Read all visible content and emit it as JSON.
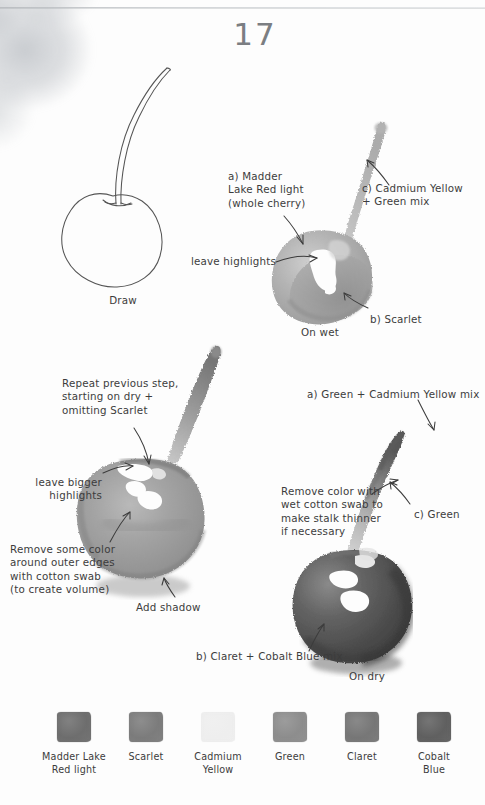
{
  "page": {
    "number": "17",
    "background_color": "#fdfdfd",
    "ink_color": "#3c3c3c"
  },
  "steps": [
    {
      "id": "draw",
      "caption": "Draw",
      "notes": []
    },
    {
      "id": "on-wet",
      "caption": "On wet",
      "notes": [
        {
          "name": "madder-lake-note",
          "text": "a) Madder\nLake Red light\n(whole cherry)"
        },
        {
          "name": "cadmium-green-note",
          "text": "c) Cadmium Yellow\n+ Green mix"
        },
        {
          "name": "leave-highlights-note",
          "text": "leave highlights"
        },
        {
          "name": "scarlet-note",
          "text": "b) Scarlet"
        }
      ]
    },
    {
      "id": "second-wash",
      "caption": "",
      "notes": [
        {
          "name": "repeat-step-note",
          "text": "Repeat previous step,\nstarting on dry +\nomitting Scarlet"
        },
        {
          "name": "leave-bigger-highlights-note",
          "text": "leave bigger\nhighlights"
        },
        {
          "name": "remove-color-edges-note",
          "text": "Remove some color\naround outer edges\nwith cotton swab\n(to create volume)"
        },
        {
          "name": "add-shadow-note",
          "text": "Add shadow"
        }
      ]
    },
    {
      "id": "on-dry",
      "caption": "On dry",
      "notes": [
        {
          "name": "green-cadmium-note",
          "text": "a) Green + Cadmium Yellow mix"
        },
        {
          "name": "remove-color-stalk-note",
          "text": "Remove color with\nwet cotton swab to\nmake stalk thinner\nif necessary"
        },
        {
          "name": "green-note",
          "text": "c) Green"
        },
        {
          "name": "claret-cobalt-note",
          "text": "b) Claret + Cobalt Blue mix"
        }
      ]
    }
  ],
  "palette": {
    "title": "",
    "swatches": [
      {
        "name": "madder-lake-red-light",
        "label": "Madder Lake\nRed light",
        "color": "#6e6e6e"
      },
      {
        "name": "scarlet",
        "label": "Scarlet",
        "color": "#7c7c7c"
      },
      {
        "name": "cadmium-yellow",
        "label": "Cadmium\nYellow",
        "color": "#eeeeee"
      },
      {
        "name": "green",
        "label": "Green",
        "color": "#8d8d8d"
      },
      {
        "name": "claret",
        "label": "Claret",
        "color": "#777777"
      },
      {
        "name": "cobalt-blue",
        "label": "Cobalt\nBlue",
        "color": "#606060"
      }
    ]
  }
}
